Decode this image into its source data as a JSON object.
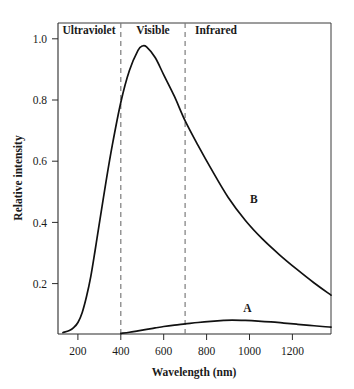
{
  "chart_data": {
    "type": "line",
    "title": "",
    "xlabel": "Wavelength (nm)",
    "ylabel": "Relative intensity",
    "xlim": [
      107,
      1380
    ],
    "ylim": [
      0,
      1.08
    ],
    "grid": false,
    "legend": "inline-curve-labels",
    "xticks": [
      200,
      400,
      600,
      800,
      1000,
      1200
    ],
    "xticklabels": [
      "200",
      "400",
      "600",
      "800",
      "1000",
      "1200"
    ],
    "yticks": [
      0.2,
      0.4,
      0.6,
      0.8,
      1.0
    ],
    "yticklabels": [
      "0.2",
      "0.4",
      "0.6",
      "0.8",
      "1.0"
    ],
    "regions": [
      {
        "name": "ultraviolet",
        "label": "Ultraviolet",
        "range": [
          107,
          400
        ]
      },
      {
        "name": "visible",
        "label": "Visible",
        "range": [
          400,
          700
        ]
      },
      {
        "name": "infrared",
        "label": "Infrared",
        "range": [
          700,
          1380
        ]
      }
    ],
    "region_boundaries_nm": [
      400,
      700
    ],
    "series": [
      {
        "name": "B",
        "label": "B",
        "label_x": 1020,
        "label_y": 0.455,
        "peak_x": 500,
        "peak_y": 1.0,
        "x": [
          130,
          160,
          180,
          200,
          220,
          240,
          260,
          280,
          300,
          330,
          360,
          400,
          440,
          480,
          500,
          520,
          560,
          600,
          650,
          700,
          760,
          820,
          900,
          980,
          1060,
          1140,
          1220,
          1300,
          1380
        ],
        "values": [
          0.005,
          0.012,
          0.022,
          0.04,
          0.075,
          0.13,
          0.2,
          0.29,
          0.385,
          0.525,
          0.655,
          0.805,
          0.915,
          0.985,
          1.0,
          0.997,
          0.96,
          0.9,
          0.825,
          0.74,
          0.655,
          0.575,
          0.475,
          0.395,
          0.33,
          0.275,
          0.225,
          0.178,
          0.135
        ]
      },
      {
        "name": "A",
        "label": "A",
        "label_x": 990,
        "label_y": 0.075,
        "peak_x": 920,
        "peak_y": 0.048,
        "x": [
          400,
          440,
          480,
          520,
          560,
          600,
          650,
          700,
          760,
          820,
          880,
          920,
          980,
          1040,
          1100,
          1160,
          1220,
          1280,
          1340,
          1380
        ],
        "values": [
          0.002,
          0.006,
          0.011,
          0.016,
          0.021,
          0.026,
          0.031,
          0.035,
          0.04,
          0.044,
          0.047,
          0.048,
          0.047,
          0.045,
          0.042,
          0.038,
          0.034,
          0.03,
          0.026,
          0.024
        ]
      }
    ],
    "colors": {
      "curve": "#111111",
      "axis": "#2b2b2b",
      "dashed_divider": "#7c7c7c",
      "background": "#ffffff",
      "text": "#1a1a1a"
    }
  }
}
